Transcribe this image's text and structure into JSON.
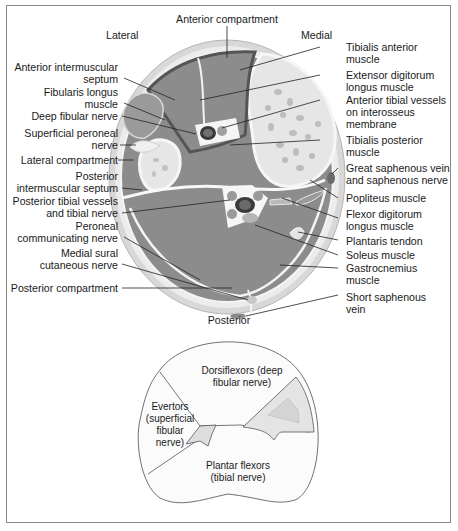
{
  "figure": {
    "orientation": {
      "top": "Anterior compartment",
      "left": "Lateral",
      "right": "Medial",
      "bottom": "Posterior"
    },
    "left_labels": [
      {
        "id": "anterior-intermuscular-septum",
        "lines": [
          "Anterior intermuscular",
          "septum"
        ]
      },
      {
        "id": "fibularis-longus-muscle",
        "lines": [
          "Fibularis longus",
          "muscle"
        ]
      },
      {
        "id": "deep-fibular-nerve",
        "lines": [
          "Deep fibular nerve"
        ]
      },
      {
        "id": "superficial-peroneal-nerve",
        "lines": [
          "Superficial peroneal",
          "nerve"
        ]
      },
      {
        "id": "lateral-compartment",
        "lines": [
          "Lateral compartment"
        ]
      },
      {
        "id": "posterior-intermuscular-septum",
        "lines": [
          "Posterior",
          "intermuscular septum"
        ]
      },
      {
        "id": "posterior-tibial-vessels",
        "lines": [
          "Posterior tibial vessels",
          "and tibial nerve"
        ]
      },
      {
        "id": "peroneal-communicating-nerve",
        "lines": [
          "Peroneal",
          "communicating nerve"
        ]
      },
      {
        "id": "medial-sural-cutaneous-nerve",
        "lines": [
          "Medial sural",
          "cutaneous nerve"
        ]
      },
      {
        "id": "posterior-compartment",
        "lines": [
          "Posterior compartment"
        ]
      }
    ],
    "right_labels": [
      {
        "id": "tibialis-anterior-muscle",
        "lines": [
          "Tibialis anterior",
          "muscle"
        ]
      },
      {
        "id": "extensor-digitorum-longus-muscle",
        "lines": [
          "Extensor digitorum",
          "longus muscle"
        ]
      },
      {
        "id": "anterior-tibial-vessels",
        "lines": [
          "Anterior tibial vessels",
          "on interosseus",
          "membrane"
        ]
      },
      {
        "id": "tibialis-posterior-muscle",
        "lines": [
          "Tibialis posterior",
          "muscle"
        ]
      },
      {
        "id": "great-saphenous-vein",
        "lines": [
          "Great saphenous vein",
          "and saphenous nerve"
        ]
      },
      {
        "id": "popliteus-muscle",
        "lines": [
          "Popliteus muscle"
        ]
      },
      {
        "id": "flexor-digitorum-longus-muscle",
        "lines": [
          "Flexor digitorum",
          "longus muscle"
        ]
      },
      {
        "id": "plantaris-tendon",
        "lines": [
          "Plantaris tendon"
        ]
      },
      {
        "id": "soleus-muscle",
        "lines": [
          "Soleus muscle"
        ]
      },
      {
        "id": "gastrocnemius-muscle",
        "lines": [
          "Gastrocnemius",
          "muscle"
        ]
      },
      {
        "id": "short-saphenous-vein",
        "lines": [
          "Short saphenous",
          "vein"
        ]
      }
    ]
  },
  "diagram": {
    "regions": [
      {
        "id": "dorsiflexors",
        "lines": [
          "Dorsiflexors (deep",
          "fibular nerve)"
        ]
      },
      {
        "id": "evertors",
        "lines": [
          "Evertors",
          "(superficial",
          "fibular",
          "nerve)"
        ]
      },
      {
        "id": "plantar-flexors",
        "lines": [
          "Plantar flexors",
          "(tibial nerve)"
        ]
      }
    ]
  },
  "colors": {
    "muscle": "#8c8c8c",
    "bone": "#e6e6e6",
    "skin": "#dcdcdc",
    "fat": "#ececec",
    "septum": "#f8f8f8",
    "fascia_dark": "#5a5a5a",
    "vessel_dark": "#3a3a3a",
    "frame": "#8a8a8a"
  }
}
